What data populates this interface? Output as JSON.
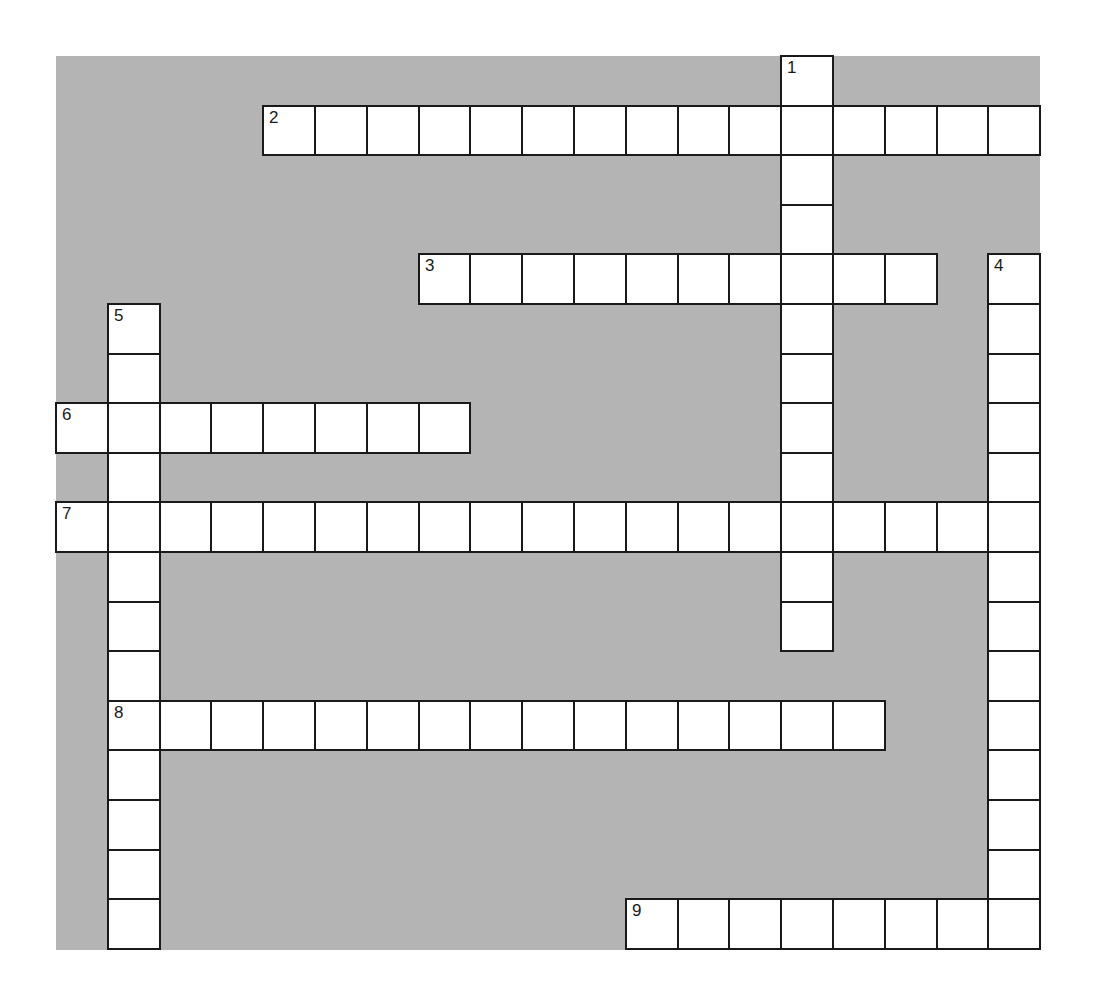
{
  "puzzle": {
    "grid": {
      "cols": 19,
      "rows": 18,
      "cell_width": 51.8,
      "cell_height": 49.6,
      "left": 56,
      "top": 56
    },
    "colors": {
      "background": "#b4b4b4",
      "cell": "#ffffff",
      "border": "#1a1a1a",
      "page": "#ffffff"
    },
    "entries": [
      {
        "number": "1",
        "direction": "down",
        "row": 0,
        "col": 14,
        "length": 12
      },
      {
        "number": "2",
        "direction": "across",
        "row": 1,
        "col": 4,
        "length": 15
      },
      {
        "number": "3",
        "direction": "across",
        "row": 4,
        "col": 7,
        "length": 10
      },
      {
        "number": "4",
        "direction": "down",
        "row": 4,
        "col": 18,
        "length": 14
      },
      {
        "number": "5",
        "direction": "down",
        "row": 5,
        "col": 1,
        "length": 13
      },
      {
        "number": "6",
        "direction": "across",
        "row": 7,
        "col": 0,
        "length": 8
      },
      {
        "number": "7",
        "direction": "across",
        "row": 9,
        "col": 0,
        "length": 19
      },
      {
        "number": "8",
        "direction": "across",
        "row": 13,
        "col": 1,
        "length": 15
      },
      {
        "number": "9",
        "direction": "across",
        "row": 17,
        "col": 11,
        "length": 8
      }
    ]
  }
}
